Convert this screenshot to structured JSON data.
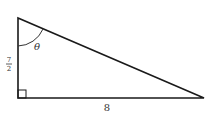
{
  "diagram": {
    "type": "right-triangle",
    "vertices": {
      "top": [
        18,
        18
      ],
      "right_angle": [
        18,
        98
      ],
      "right": [
        204,
        98
      ]
    },
    "labels": {
      "angle": "θ",
      "vertical_side_num": "7",
      "vertical_side_den": "2",
      "horizontal_side": "8"
    },
    "right_angle_marker": true,
    "angle_arc_at": "top",
    "colors": {
      "stroke": "#1a1a1a",
      "text": "#333333",
      "background": "#ffffff"
    }
  }
}
